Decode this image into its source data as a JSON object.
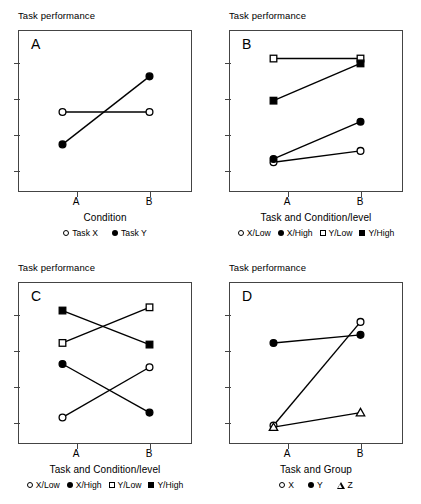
{
  "figure": {
    "panel_count": 4,
    "axis_color": "#444444",
    "marker_color": "#000000",
    "background": "#ffffff"
  },
  "chart_data": [
    {
      "type": "line",
      "panel": "A",
      "title": "",
      "ylabel": "Task performance",
      "xlabel": "Condition",
      "categories": [
        "A",
        "B"
      ],
      "x": [
        1,
        2
      ],
      "xlim": [
        0.5,
        2.5
      ],
      "ylim": [
        0,
        100
      ],
      "grid": false,
      "yticks_labeled": false,
      "ytick_count": 4,
      "legend_position": "bottom",
      "series": [
        {
          "name": "Task X",
          "marker": "circle-open",
          "values": [
            50,
            50
          ]
        },
        {
          "name": "Task Y",
          "marker": "circle-filled",
          "values": [
            30,
            72
          ]
        }
      ]
    },
    {
      "type": "line",
      "panel": "B",
      "title": "",
      "ylabel": "Task performance",
      "xlabel": "Task and Condition/level",
      "categories": [
        "A",
        "B"
      ],
      "x": [
        1,
        2
      ],
      "xlim": [
        0.5,
        2.5
      ],
      "ylim": [
        0,
        100
      ],
      "grid": false,
      "yticks_labeled": false,
      "ytick_count": 4,
      "legend_position": "bottom",
      "series": [
        {
          "name": "X/Low",
          "marker": "circle-open",
          "values": [
            19,
            26
          ]
        },
        {
          "name": "X/High",
          "marker": "circle-filled",
          "values": [
            21,
            44
          ]
        },
        {
          "name": "Y/Low",
          "marker": "square-open",
          "values": [
            83,
            83
          ]
        },
        {
          "name": "Y/High",
          "marker": "square-filled",
          "values": [
            57,
            80
          ]
        }
      ]
    },
    {
      "type": "line",
      "panel": "C",
      "title": "",
      "ylabel": "Task performance",
      "xlabel": "Task and Condition/level",
      "categories": [
        "A",
        "B"
      ],
      "x": [
        1,
        2
      ],
      "xlim": [
        0.5,
        2.5
      ],
      "ylim": [
        0,
        100
      ],
      "grid": false,
      "yticks_labeled": false,
      "ytick_count": 4,
      "legend_position": "bottom",
      "series": [
        {
          "name": "X/Low",
          "marker": "circle-open",
          "values": [
            17,
            48
          ]
        },
        {
          "name": "X/High",
          "marker": "circle-filled",
          "values": [
            50,
            20
          ]
        },
        {
          "name": "Y/Low",
          "marker": "square-open",
          "values": [
            63,
            85
          ]
        },
        {
          "name": "Y/High",
          "marker": "square-filled",
          "values": [
            83,
            62
          ]
        }
      ]
    },
    {
      "type": "line",
      "panel": "D",
      "title": "",
      "ylabel": "Task performance",
      "xlabel": "Task and Group",
      "categories": [
        "A",
        "B"
      ],
      "x": [
        1,
        2
      ],
      "xlim": [
        0.5,
        2.5
      ],
      "ylim": [
        0,
        100
      ],
      "grid": false,
      "yticks_labeled": false,
      "ytick_count": 4,
      "legend_position": "bottom",
      "series": [
        {
          "name": "X",
          "marker": "circle-open",
          "values": [
            12,
            76
          ]
        },
        {
          "name": "Y",
          "marker": "circle-filled",
          "values": [
            63,
            68
          ]
        },
        {
          "name": "Z",
          "marker": "triangle-open",
          "values": [
            11,
            20
          ]
        }
      ]
    }
  ],
  "panels": {
    "a": {
      "letter": "A",
      "ylabel": "Task performance",
      "xlabel": "Condition",
      "xticks": [
        "A",
        "B"
      ],
      "legend": [
        {
          "label": "Task X",
          "marker": "circle-open"
        },
        {
          "label": "Task Y",
          "marker": "circle-filled"
        }
      ]
    },
    "b": {
      "letter": "B",
      "ylabel": "Task performance",
      "xlabel": "Task and Condition/level",
      "xticks": [
        "A",
        "B"
      ],
      "legend": [
        {
          "label": "X/Low",
          "marker": "circle-open"
        },
        {
          "label": "X/High",
          "marker": "circle-filled"
        },
        {
          "label": "Y/Low",
          "marker": "square-open"
        },
        {
          "label": "Y/High",
          "marker": "square-filled"
        }
      ]
    },
    "c": {
      "letter": "C",
      "ylabel": "Task performance",
      "xlabel": "Task and Condition/level",
      "xticks": [
        "A",
        "B"
      ],
      "legend": [
        {
          "label": "X/Low",
          "marker": "circle-open"
        },
        {
          "label": "X/High",
          "marker": "circle-filled"
        },
        {
          "label": "Y/Low",
          "marker": "square-open"
        },
        {
          "label": "Y/High",
          "marker": "square-filled"
        }
      ]
    },
    "d": {
      "letter": "D",
      "ylabel": "Task performance",
      "xlabel": "Task and Group",
      "xticks": [
        "A",
        "B"
      ],
      "legend": [
        {
          "label": "X",
          "marker": "circle-open"
        },
        {
          "label": "Y",
          "marker": "circle-filled"
        },
        {
          "label": "Z",
          "marker": "triangle-open"
        }
      ]
    }
  }
}
